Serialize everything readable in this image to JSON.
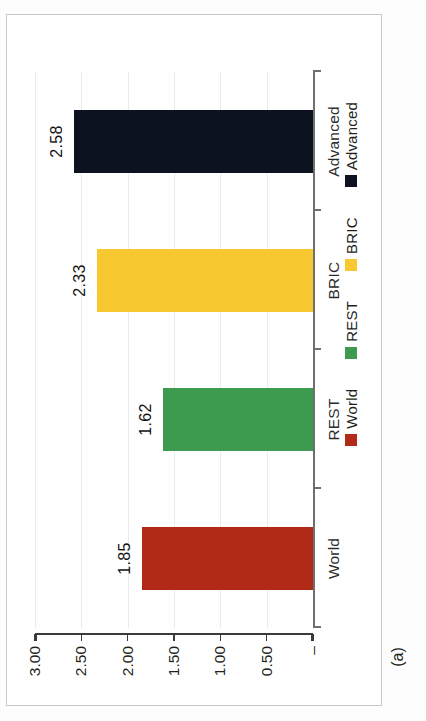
{
  "figure": {
    "caption": "(a)",
    "orientation": "rotated-90-ccw"
  },
  "chart_data": {
    "type": "bar",
    "title": "",
    "xlabel": "",
    "ylabel": "",
    "categories": [
      "World",
      "REST",
      "BRIC",
      "Advanced"
    ],
    "values": [
      1.85,
      1.62,
      2.33,
      2.58
    ],
    "value_labels": [
      "1.85",
      "1.62",
      "2.33",
      "2.58"
    ],
    "colors": [
      "#B12917",
      "#3C9B4E",
      "#F8C830",
      "#0D1220"
    ],
    "ylim": [
      0,
      3.0
    ],
    "ytick_values": [
      0,
      0.5,
      1.0,
      1.5,
      2.0,
      2.5,
      3.0
    ],
    "ytick_labels": [
      "–",
      "0.50",
      "1.00",
      "1.50",
      "2.00",
      "2.50",
      "3.00"
    ],
    "grid": true,
    "grid_color": "#EBEBEB",
    "legend_position": "bottom",
    "legend": [
      {
        "label": "Advanced",
        "color": "#0D1220"
      },
      {
        "label": "BRIC",
        "color": "#F8C830"
      },
      {
        "label": "REST",
        "color": "#3C9B4E"
      },
      {
        "label": "World",
        "color": "#B12917"
      }
    ]
  },
  "frame": {
    "border_color": "#C9C9C9",
    "background": "#FFFFFF"
  }
}
